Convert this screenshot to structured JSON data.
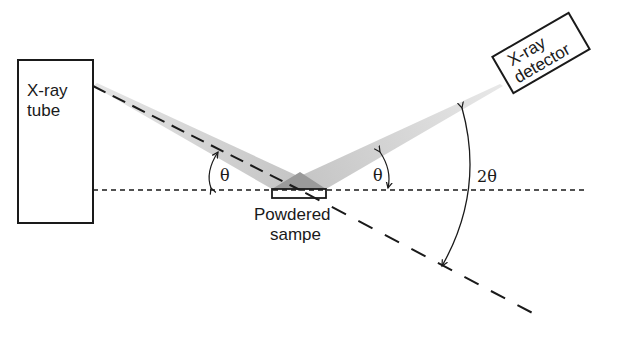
{
  "diagram": {
    "type": "x-ray powder diffraction schematic",
    "components": {
      "tube": {
        "label_line1": "X-ray",
        "label_line2": "tube"
      },
      "detector": {
        "label_line1": "X-ray",
        "label_line2": "detector"
      },
      "sample": {
        "label_line1": "Powdered",
        "label_line2": "sampe"
      }
    },
    "angles": {
      "incident": "θ",
      "diffracted": "θ",
      "total": "2θ"
    },
    "colors": {
      "stroke": "#1a1a1a",
      "beam": "#c8c8c8",
      "beam_overlap": "#9a9a9a",
      "background": "#ffffff"
    }
  }
}
